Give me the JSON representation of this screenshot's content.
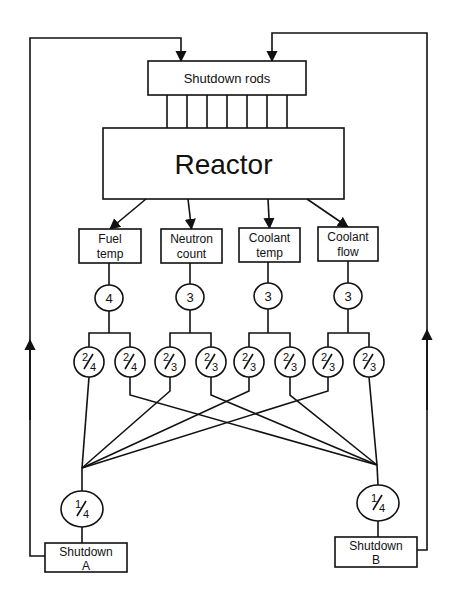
{
  "diagram": {
    "colors": {
      "line": "#111111",
      "background": "#ffffff"
    },
    "shutdown_rods": {
      "label": "Shutdown rods",
      "x": 148,
      "y": 61,
      "w": 158,
      "h": 34,
      "rod_x": [
        167,
        187,
        207,
        227,
        247,
        267,
        287
      ]
    },
    "reactor": {
      "label": "Reactor",
      "x": 103,
      "y": 128,
      "w": 241,
      "h": 71
    },
    "sensors": [
      {
        "id": "fuel-temp",
        "line1": "Fuel",
        "line2": "temp",
        "x": 79,
        "y": 229,
        "w": 62,
        "h": 34,
        "count": "4",
        "cx": 109,
        "cy": 298,
        "from_x": 146
      },
      {
        "id": "neutron-count",
        "line1": "Neutron",
        "line2": "count",
        "x": 161,
        "y": 229,
        "w": 61,
        "h": 34,
        "count": "3",
        "cx": 190,
        "cy": 297,
        "from_x": 188
      },
      {
        "id": "coolant-temp",
        "line1": "Coolant",
        "line2": "temp",
        "x": 239,
        "y": 228,
        "w": 61,
        "h": 34,
        "count": "3",
        "cx": 268,
        "cy": 296,
        "from_x": 268
      },
      {
        "id": "coolant-flow",
        "line1": "Coolant",
        "line2": "flow",
        "x": 318,
        "y": 227,
        "w": 60,
        "h": 34,
        "count": "3",
        "cx": 348,
        "cy": 296,
        "from_x": 307
      }
    ],
    "voters": [
      {
        "label_num": "2",
        "label_den": "4",
        "cx": 89,
        "to": "A"
      },
      {
        "label_num": "2",
        "label_den": "4",
        "cx": 130,
        "to": "B"
      },
      {
        "label_num": "2",
        "label_den": "3",
        "cx": 170,
        "to": "A"
      },
      {
        "label_num": "2",
        "label_den": "3",
        "cx": 211,
        "to": "B"
      },
      {
        "label_num": "2",
        "label_den": "3",
        "cx": 249,
        "to": "A"
      },
      {
        "label_num": "2",
        "label_den": "3",
        "cx": 290,
        "to": "B"
      },
      {
        "label_num": "2",
        "label_den": "3",
        "cx": 328,
        "to": "A"
      },
      {
        "label_num": "2",
        "label_den": "3",
        "cx": 369,
        "to": "B"
      }
    ],
    "voter_y": 362,
    "branch_y": 333,
    "junctions": {
      "A": {
        "x": 82,
        "y": 468
      },
      "B": {
        "x": 377,
        "y": 465
      }
    },
    "final_voters": [
      {
        "id": "A",
        "label_num": "1",
        "label_den": "4",
        "cx": 82,
        "cy": 509
      },
      {
        "id": "B",
        "label_num": "1",
        "label_den": "4",
        "cx": 378,
        "cy": 503
      }
    ],
    "shutdown_systems": [
      {
        "id": "A",
        "line1": "Shutdown",
        "line2": "A",
        "x": 45,
        "y": 543,
        "w": 82,
        "h": 29
      },
      {
        "id": "B",
        "line1": "Shutdown",
        "line2": "B",
        "x": 335,
        "y": 537,
        "w": 82,
        "h": 30
      }
    ],
    "feedback": {
      "A": {
        "side_x": 30,
        "top_y": 38,
        "arrow_x": 181,
        "box_y": 556
      },
      "B": {
        "side_x": 427,
        "top_y": 33,
        "arrow_x": 272,
        "box_y": 550
      }
    }
  }
}
